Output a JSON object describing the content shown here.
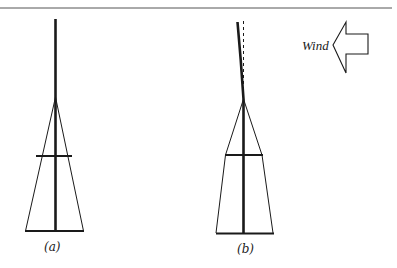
{
  "figure": {
    "panels": [
      {
        "id": "a",
        "label": "(a)",
        "description": "Guyed mast at rest, vertical"
      },
      {
        "id": "b",
        "label": "(b)",
        "description": "Guyed mast deflected by wind, dashed line shows original vertical position"
      }
    ],
    "wind": {
      "label": "Wind",
      "direction": "left",
      "icon": "left-arrow-icon"
    },
    "colors": {
      "ink": "#1a1a1a",
      "background": "#ffffff"
    }
  }
}
